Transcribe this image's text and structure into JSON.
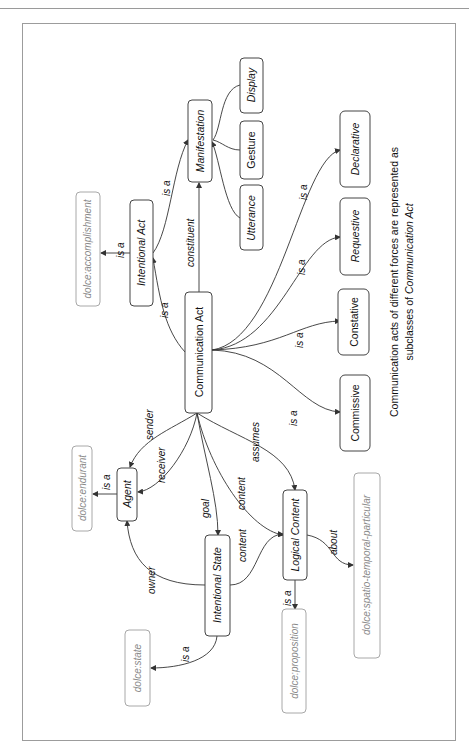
{
  "diagram": {
    "orientation": "rotated-90-ccw",
    "nodes": {
      "communication_act": "Communication Act",
      "intentional_act": "Intentional Act",
      "manifestation": "Manifestation",
      "utterance": "Utterance",
      "gesture": "Gesture",
      "display": "Display",
      "declarative": "Declarative",
      "requestive": "Requestive",
      "constative": "Constative",
      "commissive": "Commissive",
      "agent": "Agent",
      "intentional_state": "Intentional State",
      "logical_content": "Logical Content"
    },
    "external_nodes": {
      "accomplishment": "dolce:accomplishment",
      "endurant": "dolce:endurant",
      "state": "dolce:state",
      "proposition": "dolce:proposition",
      "spatio_temporal": "dolce:spatio-temporal-particular"
    },
    "edge_labels": {
      "ca_is_a_ia": "is a",
      "ia_is_a_accomplishment": "is a",
      "ia_is_a_manifestation": "is a",
      "constituent": "constituent",
      "sender": "sender",
      "receiver": "receiver",
      "agent_is_a": "is a",
      "goal": "goal",
      "content_ca_lc": "content",
      "assumes": "assumes",
      "content_is_lc": "content",
      "owner": "owner",
      "is_is_a_state": "is a",
      "lc_is_a_proposition": "is a",
      "about": "about",
      "is_a_commissive": "is a",
      "is_a_constative": "is a",
      "is_a_requestive": "is a",
      "is_a_declarative": "is a"
    },
    "note": {
      "line1": "Communication acts of different forces are represented as",
      "line2_prefix": "subclasses of ",
      "line2_emph": "Communication Act"
    }
  }
}
